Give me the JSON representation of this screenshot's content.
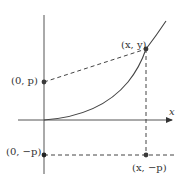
{
  "diagram": {
    "axis_x_label": "x",
    "points": {
      "point_xy": {
        "label": "(x, y)",
        "cx": 146,
        "cy": 49
      },
      "focus": {
        "label": "(0, p)",
        "cx": 44,
        "cy": 82
      },
      "directrix_intercept": {
        "label": "(0, −p)",
        "cx": 44,
        "cy": 155
      },
      "directrix_foot": {
        "label": "(x, −p)",
        "cx": 146,
        "cy": 155
      }
    },
    "colors": {
      "ink": "#333333",
      "point": "#3a3a3a",
      "background": "#ffffff"
    }
  }
}
